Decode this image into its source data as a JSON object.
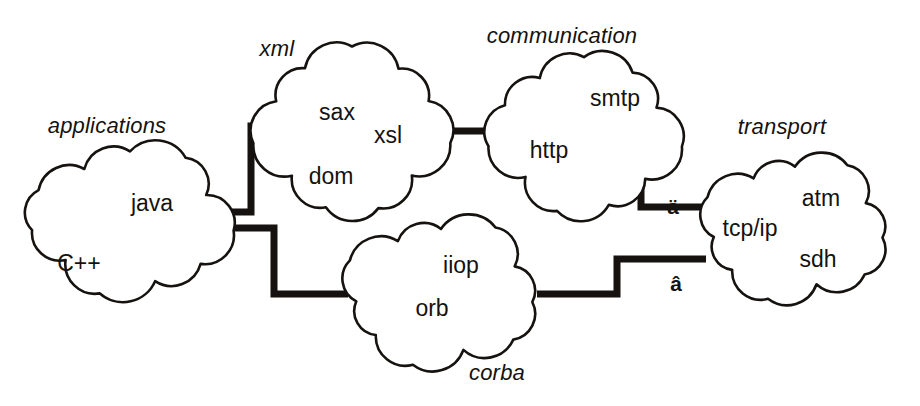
{
  "diagram": {
    "background": "#ffffff",
    "ink": "#15120f",
    "clouds": [
      {
        "id": "applications",
        "title": "applications",
        "title_pos": {
          "x": 107,
          "y": 126
        },
        "box": {
          "x": 24,
          "y": 144,
          "w": 212,
          "h": 152
        },
        "items": [
          {
            "label": "java",
            "x": 152,
            "y": 203
          },
          {
            "label": "C++",
            "x": 79,
            "y": 263
          }
        ]
      },
      {
        "id": "xml",
        "title": "xml",
        "title_pos": {
          "x": 277,
          "y": 49
        },
        "box": {
          "x": 253,
          "y": 46,
          "w": 198,
          "h": 170
        },
        "items": [
          {
            "label": "sax",
            "x": 337,
            "y": 112
          },
          {
            "label": "xsl",
            "x": 388,
            "y": 135
          },
          {
            "label": "dom",
            "x": 331,
            "y": 176
          }
        ]
      },
      {
        "id": "communication",
        "title": "communication",
        "title_pos": {
          "x": 562,
          "y": 36
        },
        "box": {
          "x": 486,
          "y": 54,
          "w": 196,
          "h": 162
        },
        "items": [
          {
            "label": "smtp",
            "x": 615,
            "y": 98
          }
        ]
      },
      {
        "id": "transport",
        "title": "transport",
        "title_pos": {
          "x": 782,
          "y": 127
        },
        "box": {
          "x": 699,
          "y": 154,
          "w": 192,
          "h": 148
        },
        "items": [
          {
            "label": "atm",
            "x": 821,
            "y": 198
          },
          {
            "label": "tcp/ip",
            "x": 750,
            "y": 228
          },
          {
            "label": "sdh",
            "x": 818,
            "y": 259
          }
        ]
      },
      {
        "id": "corba",
        "title": "corba",
        "title_pos": {
          "x": 497,
          "y": 373
        },
        "box": {
          "x": 341,
          "y": 216,
          "w": 200,
          "h": 152
        },
        "items": [
          {
            "label": "iiop",
            "x": 461,
            "y": 265
          },
          {
            "label": "orb",
            "x": 432,
            "y": 308
          }
        ]
      }
    ],
    "connectors": [
      {
        "id": "applications-to-xml",
        "from": "applications",
        "to": "xml",
        "path": "M 232 212 L 251 212 L 251 126 L 268 126"
      },
      {
        "id": "applications-to-corba",
        "from": "applications",
        "to": "corba",
        "path": "M 232 228 L 274 228 L 274 294 L 348 294"
      },
      {
        "id": "xml-to-communication",
        "from": "xml",
        "to": "communication",
        "path": "M 447 131 L 500 131"
      },
      {
        "id": "communication-to-transport",
        "from": "communication",
        "to": "transport",
        "label": "http",
        "label_pos": {
          "x": 549,
          "y": 150
        },
        "path": "M 500 150 L 641 150 L 641 207 L 706 207"
      },
      {
        "id": "corba-to-transport",
        "from": "corba",
        "to": "transport",
        "path": "M 537 294 L 617 294 L 617 259 L 706 259"
      }
    ],
    "markers": [
      {
        "id": "marker-upper",
        "glyph": "ä",
        "x": 673,
        "y": 206
      },
      {
        "id": "marker-lower",
        "glyph": "â",
        "x": 676,
        "y": 283
      }
    ]
  }
}
